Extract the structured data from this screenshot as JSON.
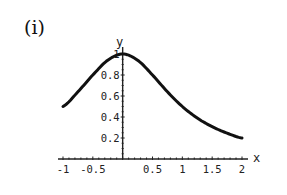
{
  "panel": {
    "label": "(i)"
  },
  "chart_data": {
    "type": "line",
    "title": "",
    "panel_label": "(i)",
    "xlabel": "x",
    "ylabel": "y",
    "xlim": [
      -1,
      2
    ],
    "ylim": [
      0,
      1
    ],
    "x_ticks": [
      -1,
      -0.5,
      0.5,
      1,
      1.5,
      2
    ],
    "x_tick_labels": [
      "-1",
      "-0.5",
      "0.5",
      "1",
      "1.5",
      "2"
    ],
    "y_ticks": [
      0.2,
      0.4,
      0.6,
      0.8,
      1
    ],
    "y_tick_labels": [
      "0.2",
      "0.4",
      "0.6",
      "0.8",
      "1"
    ],
    "grid": false,
    "legend": null,
    "series": [
      {
        "name": "y = 1/(1+x^2)",
        "x": [
          -1,
          -0.75,
          -0.5,
          -0.25,
          0,
          0.25,
          0.5,
          0.75,
          1,
          1.25,
          1.5,
          1.75,
          2
        ],
        "values": [
          0.5,
          0.64,
          0.8,
          0.941,
          1.0,
          0.941,
          0.8,
          0.64,
          0.5,
          0.39,
          0.308,
          0.246,
          0.2
        ]
      }
    ]
  },
  "style": {
    "line_color": "#111111",
    "axis_color": "#222222"
  }
}
